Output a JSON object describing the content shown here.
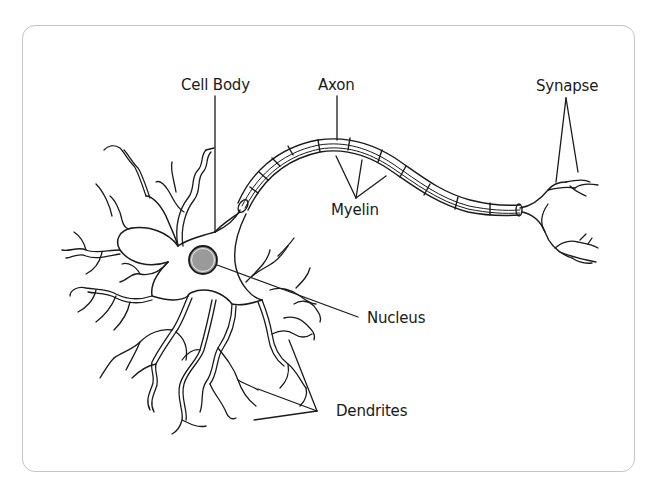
{
  "diagram": {
    "labels": {
      "cell_body": "Cell Body",
      "axon": "Axon",
      "synapse": "Synapse",
      "myelin": "Myelin",
      "nucleus": "Nucleus",
      "dendrites": "Dendrites"
    },
    "colors": {
      "stroke": "#1a1a1a",
      "nucleus_fill": "#9a9a9a",
      "card_border": "#c4c4c4",
      "background": "#ffffff"
    }
  }
}
